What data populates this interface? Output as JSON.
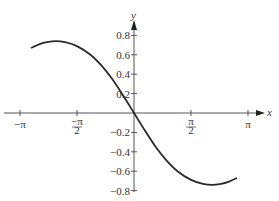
{
  "chart_data": {
    "type": "line",
    "title": "",
    "xlabel": "x",
    "ylabel": "y",
    "xlim": [
      -3.3,
      3.35
    ],
    "ylim": [
      -0.83,
      0.88
    ],
    "grid": false,
    "legend": null,
    "x_ticks": [
      {
        "value": -3.14159,
        "label": "−π"
      },
      {
        "value": -1.5708,
        "label": "−π/2"
      },
      {
        "value": 1.5708,
        "label": "π/2"
      },
      {
        "value": 3.14159,
        "label": "π"
      }
    ],
    "y_ticks": [
      {
        "value": 0.8,
        "label": "0.8"
      },
      {
        "value": 0.6,
        "label": "0.6"
      },
      {
        "value": 0.4,
        "label": "0.4"
      },
      {
        "value": 0.2,
        "label": "0.2"
      },
      {
        "value": -0.2,
        "label": "−0.2"
      },
      {
        "value": -0.4,
        "label": "−0.4"
      },
      {
        "value": -0.6,
        "label": "−0.6"
      },
      {
        "value": -0.8,
        "label": "−0.8"
      }
    ],
    "series": [
      {
        "name": "curve",
        "color": "#2a2a2a",
        "x": [
          -2.84,
          -2.6,
          -2.4,
          -2.15,
          -1.9,
          -1.5708,
          -1.2,
          -0.9,
          -0.6,
          -0.3,
          0,
          0.3,
          0.6,
          0.9,
          1.2,
          1.5708,
          1.9,
          2.15,
          2.4,
          2.6,
          2.84
        ],
        "y": [
          0.67,
          0.71,
          0.73,
          0.74,
          0.73,
          0.69,
          0.6,
          0.49,
          0.35,
          0.18,
          0,
          -0.18,
          -0.35,
          -0.49,
          -0.6,
          -0.69,
          -0.73,
          -0.74,
          -0.73,
          -0.71,
          -0.67
        ]
      }
    ]
  }
}
